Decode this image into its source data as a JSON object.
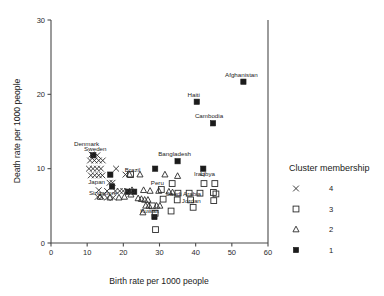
{
  "chart_data": {
    "type": "scatter",
    "title": "",
    "xlabel": "Birth rate per 1000 people",
    "ylabel": "Death rate per 1000 people",
    "xlim": [
      0,
      60
    ],
    "ylim": [
      0,
      30
    ],
    "xticks": [
      0,
      10,
      20,
      30,
      40,
      50,
      60
    ],
    "yticks": [
      0,
      10,
      20,
      30
    ],
    "grid": false,
    "legend": {
      "title": "Cluster membership",
      "position": "right",
      "entries": [
        {
          "label": "4",
          "marker": "cross-marker",
          "cluster": 4
        },
        {
          "label": "3",
          "marker": "open-square-marker",
          "cluster": 3
        },
        {
          "label": "2",
          "marker": "open-triangle-marker",
          "cluster": 2
        },
        {
          "label": "1",
          "marker": "filled-square-marker",
          "cluster": 1
        }
      ]
    },
    "series": [
      {
        "name": "Cluster 1",
        "cluster": 1,
        "marker": "filled-square-marker",
        "points": [
          {
            "x": 53.2,
            "y": 21.7,
            "label": "Afghanistan",
            "label_dx": -2,
            "label_dy": -5
          },
          {
            "x": 40.3,
            "y": 19.0,
            "label": "Haiti",
            "label_dx": -3,
            "label_dy": -5
          },
          {
            "x": 44.8,
            "y": 16.1,
            "label": "Cambodia",
            "label_dx": -4,
            "label_dy": -5
          },
          {
            "x": 35.0,
            "y": 11.0,
            "label": "Bangladesh",
            "label_dx": -3,
            "label_dy": -5
          },
          {
            "x": 28.8,
            "y": 10.0,
            "label": "",
            "label_dx": 0,
            "label_dy": 0
          },
          {
            "x": 42.1,
            "y": 10.0,
            "label": "",
            "label_dx": 0,
            "label_dy": 0
          },
          {
            "x": 11.7,
            "y": 11.8,
            "label": "",
            "label_dx": 0,
            "label_dy": 0
          },
          {
            "x": 16.4,
            "y": 9.2,
            "label": "",
            "label_dx": 0,
            "label_dy": 0
          },
          {
            "x": 16.9,
            "y": 7.6,
            "label": "",
            "label_dx": 0,
            "label_dy": 0
          },
          {
            "x": 21.3,
            "y": 6.9,
            "label": "",
            "label_dx": 0,
            "label_dy": 0
          },
          {
            "x": 23.0,
            "y": 6.9,
            "label": "",
            "label_dx": 0,
            "label_dy": 0
          },
          {
            "x": 28.6,
            "y": 3.5,
            "label": "Kuwait",
            "label_dx": -5,
            "label_dy": -4
          }
        ]
      },
      {
        "name": "Cluster 2",
        "cluster": 2,
        "marker": "open-triangle-marker",
        "points": [
          {
            "x": 21.7,
            "y": 9.2,
            "label": "",
            "label_dx": 0,
            "label_dy": 0
          },
          {
            "x": 24.6,
            "y": 9.2,
            "label": "",
            "label_dx": 0,
            "label_dy": 0
          },
          {
            "x": 31.5,
            "y": 9.2,
            "label": "",
            "label_dx": 0,
            "label_dy": 0
          },
          {
            "x": 35.0,
            "y": 9.0,
            "label": "",
            "label_dx": 0,
            "label_dy": 0
          },
          {
            "x": 22.4,
            "y": 7.1,
            "label": "",
            "label_dx": 0,
            "label_dy": 0
          },
          {
            "x": 25.6,
            "y": 7.1,
            "label": "",
            "label_dx": 0,
            "label_dy": 0
          },
          {
            "x": 27.4,
            "y": 7.0,
            "label": "",
            "label_dx": 0,
            "label_dy": 0
          },
          {
            "x": 29.8,
            "y": 7.0,
            "label": "",
            "label_dx": 0,
            "label_dy": 0
          },
          {
            "x": 32.6,
            "y": 6.9,
            "label": "",
            "label_dx": 0,
            "label_dy": 0
          },
          {
            "x": 33.6,
            "y": 6.8,
            "label": "",
            "label_dx": 0,
            "label_dy": 0
          },
          {
            "x": 18.8,
            "y": 6.1,
            "label": "",
            "label_dx": 0,
            "label_dy": 0
          },
          {
            "x": 20.3,
            "y": 6.2,
            "label": "",
            "label_dx": 0,
            "label_dy": 0
          },
          {
            "x": 16.3,
            "y": 6.1,
            "label": "",
            "label_dx": 0,
            "label_dy": 0
          },
          {
            "x": 24.1,
            "y": 6.0,
            "label": "",
            "label_dx": 0,
            "label_dy": 0
          },
          {
            "x": 25.0,
            "y": 5.9,
            "label": "",
            "label_dx": 0,
            "label_dy": 0
          },
          {
            "x": 25.9,
            "y": 5.8,
            "label": "",
            "label_dx": 0,
            "label_dy": 0
          },
          {
            "x": 26.8,
            "y": 5.8,
            "label": "",
            "label_dx": 0,
            "label_dy": 0
          },
          {
            "x": 26.2,
            "y": 5.0,
            "label": "",
            "label_dx": 0,
            "label_dy": 0
          },
          {
            "x": 27.1,
            "y": 5.0,
            "label": "",
            "label_dx": 0,
            "label_dy": 0
          },
          {
            "x": 29.2,
            "y": 5.0,
            "label": "",
            "label_dx": 0,
            "label_dy": 0
          },
          {
            "x": 30.1,
            "y": 5.0,
            "label": "",
            "label_dx": 0,
            "label_dy": 0
          },
          {
            "x": 25.4,
            "y": 4.1,
            "label": "",
            "label_dx": 0,
            "label_dy": 0
          },
          {
            "x": 13.6,
            "y": 6.2,
            "label": "",
            "label_dx": 0,
            "label_dy": 0
          },
          {
            "x": 22.1,
            "y": 6.5,
            "label": "",
            "label_dx": 0,
            "label_dy": 0
          }
        ]
      },
      {
        "name": "Cluster 3",
        "cluster": 3,
        "marker": "open-square-marker",
        "points": [
          {
            "x": 33.5,
            "y": 8.0,
            "label": "",
            "label_dx": 0,
            "label_dy": 0
          },
          {
            "x": 42.3,
            "y": 8.0,
            "label": "",
            "label_dx": 0,
            "label_dy": 0
          },
          {
            "x": 45.3,
            "y": 8.0,
            "label": "",
            "label_dx": 0,
            "label_dy": 0
          },
          {
            "x": 30.5,
            "y": 7.2,
            "label": "Peru",
            "label_dx": -4,
            "label_dy": -4
          },
          {
            "x": 35.1,
            "y": 6.7,
            "label": "",
            "label_dx": 0,
            "label_dy": 0
          },
          {
            "x": 38.2,
            "y": 6.7,
            "label": "",
            "label_dx": 0,
            "label_dy": 0
          },
          {
            "x": 41.2,
            "y": 6.7,
            "label": "",
            "label_dx": 0,
            "label_dy": 0
          },
          {
            "x": 44.9,
            "y": 6.8,
            "label": "",
            "label_dx": 0,
            "label_dy": 0
          },
          {
            "x": 45.6,
            "y": 6.6,
            "label": "",
            "label_dx": 0,
            "label_dy": 0
          },
          {
            "x": 34.9,
            "y": 5.8,
            "label": "",
            "label_dx": 0,
            "label_dy": 0
          },
          {
            "x": 38.6,
            "y": 5.8,
            "label": "",
            "label_dx": 0,
            "label_dy": 0
          },
          {
            "x": 45.0,
            "y": 5.7,
            "label": "",
            "label_dx": 0,
            "label_dy": 0
          },
          {
            "x": 39.3,
            "y": 4.8,
            "label": "",
            "label_dx": 0,
            "label_dy": 0
          },
          {
            "x": 33.2,
            "y": 4.3,
            "label": "",
            "label_dx": 0,
            "label_dy": 0
          },
          {
            "x": 28.8,
            "y": 4.0,
            "label": "",
            "label_dx": 0,
            "label_dy": 0
          },
          {
            "x": 28.9,
            "y": 1.8,
            "label": "",
            "label_dx": 0,
            "label_dy": 0
          },
          {
            "x": 28.0,
            "y": 5.0,
            "label": "",
            "label_dx": 0,
            "label_dy": 0
          },
          {
            "x": 31.0,
            "y": 5.9,
            "label": "",
            "label_dx": 0,
            "label_dy": 0
          },
          {
            "x": 22.0,
            "y": 9.2,
            "label": "Brazil",
            "label_dx": 2,
            "label_dy": -3
          }
        ]
      },
      {
        "name": "Cluster 4",
        "cluster": 4,
        "marker": "cross-marker",
        "points": [
          {
            "x": 11.2,
            "y": 11.9,
            "label": "Denmark",
            "label_dx": -5,
            "label_dy": -9
          },
          {
            "x": 12.8,
            "y": 11.8,
            "label": "Sweden",
            "label_dx": -2,
            "label_dy": -4
          },
          {
            "x": 10.8,
            "y": 11.1,
            "label": "",
            "label_dx": 0,
            "label_dy": 0
          },
          {
            "x": 12.0,
            "y": 11.1,
            "label": "",
            "label_dx": 0,
            "label_dy": 0
          },
          {
            "x": 13.2,
            "y": 11.1,
            "label": "",
            "label_dx": 0,
            "label_dy": 0
          },
          {
            "x": 14.3,
            "y": 11.1,
            "label": "",
            "label_dx": 0,
            "label_dy": 0
          },
          {
            "x": 10.5,
            "y": 10.0,
            "label": "",
            "label_dx": 0,
            "label_dy": 0
          },
          {
            "x": 11.6,
            "y": 10.0,
            "label": "",
            "label_dx": 0,
            "label_dy": 0
          },
          {
            "x": 12.7,
            "y": 10.0,
            "label": "",
            "label_dx": 0,
            "label_dy": 0
          },
          {
            "x": 13.8,
            "y": 10.0,
            "label": "",
            "label_dx": 0,
            "label_dy": 0
          },
          {
            "x": 18.0,
            "y": 10.0,
            "label": "",
            "label_dx": 0,
            "label_dy": 0
          },
          {
            "x": 11.0,
            "y": 9.1,
            "label": "",
            "label_dx": 0,
            "label_dy": 0
          },
          {
            "x": 12.1,
            "y": 9.1,
            "label": "",
            "label_dx": 0,
            "label_dy": 0
          },
          {
            "x": 13.2,
            "y": 9.1,
            "label": "",
            "label_dx": 0,
            "label_dy": 0
          },
          {
            "x": 14.2,
            "y": 9.1,
            "label": "",
            "label_dx": 0,
            "label_dy": 0
          },
          {
            "x": 20.6,
            "y": 9.2,
            "label": "",
            "label_dx": 0,
            "label_dy": 0
          },
          {
            "x": 16.2,
            "y": 8.1,
            "label": "Japan",
            "label_dx": -13,
            "label_dy": 1
          },
          {
            "x": 17.0,
            "y": 8.1,
            "label": "",
            "label_dx": 0,
            "label_dy": 0
          },
          {
            "x": 13.2,
            "y": 7.1,
            "label": "",
            "label_dx": 0,
            "label_dy": 0
          },
          {
            "x": 15.5,
            "y": 7.0,
            "label": "Singapore",
            "label_dx": -4,
            "label_dy": 4
          },
          {
            "x": 17.8,
            "y": 7.0,
            "label": "",
            "label_dx": 0,
            "label_dy": 0
          },
          {
            "x": 19.0,
            "y": 7.0,
            "label": "",
            "label_dx": 0,
            "label_dy": 0
          },
          {
            "x": 20.0,
            "y": 7.0,
            "label": "",
            "label_dx": 0,
            "label_dy": 0
          },
          {
            "x": 21.0,
            "y": 7.0,
            "label": "",
            "label_dx": 0,
            "label_dy": 0
          },
          {
            "x": 14.0,
            "y": 6.2,
            "label": "",
            "label_dx": 0,
            "label_dy": 0
          },
          {
            "x": 15.5,
            "y": 6.1,
            "label": "",
            "label_dx": 0,
            "label_dy": 0
          },
          {
            "x": 17.2,
            "y": 6.1,
            "label": "",
            "label_dx": 0,
            "label_dy": 0
          },
          {
            "x": 12.9,
            "y": 6.2,
            "label": "",
            "label_dx": 0,
            "label_dy": 0
          }
        ]
      }
    ],
    "extra_annotations": [
      {
        "text": "Iraq",
        "x": 41.0,
        "y": 9.0
      },
      {
        "text": "Libya",
        "x": 43.3,
        "y": 9.0
      },
      {
        "text": "Saudi Arabia",
        "x": 36.6,
        "y": 6.3
      },
      {
        "text": "Jordan",
        "x": 38.8,
        "y": 5.4
      }
    ]
  }
}
